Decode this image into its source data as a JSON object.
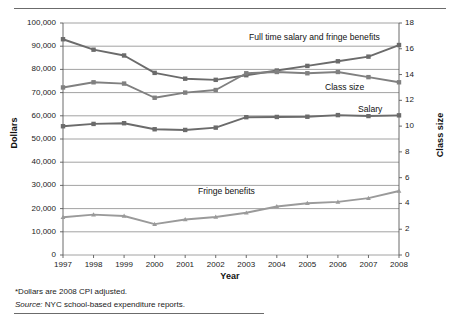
{
  "chart_data": {
    "type": "line",
    "title": "",
    "xlabel": "Year",
    "ylabel": "Dollars",
    "ylabel_secondary": "Class size",
    "grid": true,
    "legend_position": "inline-annotations",
    "x": [
      1997,
      1998,
      1999,
      2000,
      2001,
      2002,
      2003,
      2004,
      2005,
      2006,
      2007,
      2008
    ],
    "xtick_labels": [
      "1997",
      "1998",
      "1999",
      "2000",
      "2001",
      "2002",
      "2003",
      "2004",
      "2005",
      "2006",
      "2007",
      "2008"
    ],
    "ylim": [
      0,
      100000
    ],
    "ytick_labels": [
      "0",
      "10,000",
      "20,000",
      "30,000",
      "40,000",
      "50,000",
      "60,000",
      "70,000",
      "80,000",
      "90,000",
      "100,000"
    ],
    "ytick_values": [
      0,
      10000,
      20000,
      30000,
      40000,
      50000,
      60000,
      70000,
      80000,
      90000,
      100000
    ],
    "ylim_secondary": [
      0,
      18
    ],
    "ytick_labels_secondary": [
      "0",
      "2",
      "4",
      "6",
      "8",
      "10",
      "12",
      "14",
      "16",
      "18"
    ],
    "ytick_values_secondary": [
      0,
      2,
      4,
      6,
      8,
      10,
      12,
      14,
      16,
      18
    ],
    "series": [
      {
        "name": "Full time salary and fringe benefits",
        "axis": "left",
        "color": "#6b6b6b",
        "marker": "square",
        "values": [
          93000,
          88500,
          86000,
          78500,
          76000,
          75500,
          77500,
          79500,
          81500,
          83500,
          85500,
          90500
        ]
      },
      {
        "name": "Class size",
        "axis": "right",
        "color": "#808080",
        "marker": "square",
        "values": [
          13.0,
          13.4,
          13.3,
          12.2,
          12.6,
          12.8,
          14.1,
          14.2,
          14.1,
          14.2,
          13.8,
          13.4
        ]
      },
      {
        "name": "Salary",
        "axis": "left",
        "color": "#6b6b6b",
        "marker": "square",
        "values": [
          55500,
          56500,
          56800,
          54200,
          53900,
          54900,
          59400,
          59500,
          59600,
          60300,
          59900,
          60200
        ]
      },
      {
        "name": "Fringe benefits",
        "axis": "left",
        "color": "#9a9a9a",
        "marker": "triangle",
        "values": [
          16300,
          17400,
          16800,
          13300,
          15300,
          16400,
          18200,
          20900,
          22300,
          22900,
          24500,
          27600
        ]
      }
    ],
    "annotations": [
      {
        "text": "Full time salary and fringe benefits",
        "x": 1.0,
        "y": 0.0
      },
      {
        "text": "Class size",
        "x": 0.0,
        "y": 0.0
      },
      {
        "text": "Salary",
        "x": 0.0,
        "y": 0.0
      },
      {
        "text": "Fringe benefits",
        "x": 0.0,
        "y": 0.0
      }
    ]
  },
  "labels": {
    "full_time": "Full time salary and fringe benefits",
    "class_size": "Class size",
    "salary": "Salary",
    "fringe_benefits": "Fringe benefits"
  },
  "axes": {
    "left_title": "Dollars",
    "right_title": "Class size",
    "x_title": "Year"
  },
  "notes": {
    "dollars": "*Dollars are 2008 CPI adjusted.",
    "source_prefix": "Source:",
    "source_text": "NYC school-based expenditure reports."
  },
  "colors": {
    "frame": "#5a5a5a",
    "grid": "#8a8a8a",
    "series_dark": "#6b6b6b",
    "series_mid": "#808080",
    "series_light": "#9a9a9a",
    "text": "#1a1a1a"
  }
}
